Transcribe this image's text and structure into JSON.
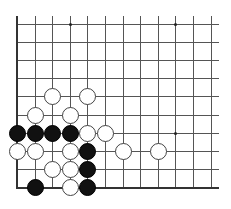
{
  "board": {
    "cols": 12,
    "rows": 10,
    "origin_x": 17,
    "origin_y": 24,
    "spacing_x": 17.6,
    "spacing_y": 18.1,
    "line_extend_top": 8,
    "line_extend_right": 8,
    "edges": [
      "left",
      "bottom"
    ],
    "colors": {
      "line": "#555555",
      "edge": "#333333",
      "black": "#111111",
      "white": "#ffffff",
      "white_border": "#444444"
    },
    "star_points": [
      {
        "col": 3,
        "row": 0
      },
      {
        "col": 9,
        "row": 0
      },
      {
        "col": 9,
        "row": 6
      }
    ],
    "stones": [
      {
        "color": "white",
        "col": 2,
        "row": 4
      },
      {
        "color": "white",
        "col": 4,
        "row": 4
      },
      {
        "color": "white",
        "col": 1,
        "row": 5
      },
      {
        "color": "white",
        "col": 3,
        "row": 5
      },
      {
        "color": "black",
        "col": 0,
        "row": 6
      },
      {
        "color": "black",
        "col": 1,
        "row": 6
      },
      {
        "color": "black",
        "col": 2,
        "row": 6
      },
      {
        "color": "black",
        "col": 3,
        "row": 6
      },
      {
        "color": "white",
        "col": 4,
        "row": 6
      },
      {
        "color": "white",
        "col": 5,
        "row": 6
      },
      {
        "color": "white",
        "col": 0,
        "row": 7
      },
      {
        "color": "white",
        "col": 1,
        "row": 7
      },
      {
        "color": "white",
        "col": 3,
        "row": 7
      },
      {
        "color": "black",
        "col": 4,
        "row": 7
      },
      {
        "color": "white",
        "col": 6,
        "row": 7
      },
      {
        "color": "white",
        "col": 8,
        "row": 7
      },
      {
        "color": "white",
        "col": 2,
        "row": 8
      },
      {
        "color": "white",
        "col": 3,
        "row": 8
      },
      {
        "color": "black",
        "col": 4,
        "row": 8
      },
      {
        "color": "black",
        "col": 1,
        "row": 9
      },
      {
        "color": "white",
        "col": 3,
        "row": 9
      },
      {
        "color": "black",
        "col": 4,
        "row": 9
      }
    ]
  }
}
